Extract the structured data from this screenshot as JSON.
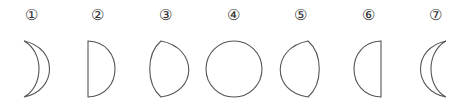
{
  "figure": {
    "stroke_color": "#555555",
    "background": "#ffffff",
    "items": [
      {
        "label": "①",
        "shape": "waxing-crescent",
        "x": 31
      },
      {
        "label": "②",
        "shape": "first-quarter-half",
        "x": 97
      },
      {
        "label": "③",
        "shape": "gibbous-left-bulge",
        "x": 165
      },
      {
        "label": "④",
        "shape": "full-circle",
        "x": 233
      },
      {
        "label": "⑤",
        "shape": "gibbous-right-bulge",
        "x": 300
      },
      {
        "label": "⑥",
        "shape": "last-quarter-half",
        "x": 368
      },
      {
        "label": "⑦",
        "shape": "waning-crescent",
        "x": 435
      }
    ]
  }
}
